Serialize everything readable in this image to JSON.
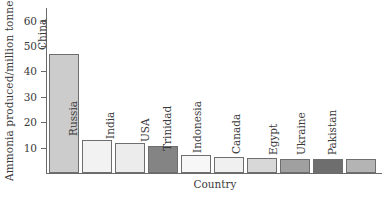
{
  "chart_data": {
    "type": "bar",
    "title": "",
    "xlabel": "Country",
    "ylabel": "Ammonia produced/million tonnes",
    "categories": [
      "China",
      "Russia",
      "India",
      "USA",
      "Trinidad",
      "Indonesia",
      "Canada",
      "Egypt",
      "Ukraine",
      "Pakistan"
    ],
    "values": [
      47,
      13,
      12,
      10.5,
      7,
      6.5,
      6,
      5.5,
      5.5,
      5.5
    ],
    "bar_colors": [
      "#cccccc",
      "#f2f2f2",
      "#ececec",
      "#848484",
      "#f7f7f7",
      "#f0f0f0",
      "#d8d8d8",
      "#a0a0a0",
      "#6e6e6e",
      "#b4b4b4"
    ],
    "ylim": [
      0,
      65
    ],
    "yticks": [
      10,
      20,
      30,
      40,
      50,
      60
    ],
    "ytick_labels": [
      "10",
      "20",
      "30",
      "40",
      "50",
      "60"
    ],
    "grid": false,
    "legend": "none",
    "axis_color": "#6a6a6a",
    "bar_border_color": "#6e6e6e",
    "text_color": "#3a3a3a",
    "background": "#ffffff"
  }
}
